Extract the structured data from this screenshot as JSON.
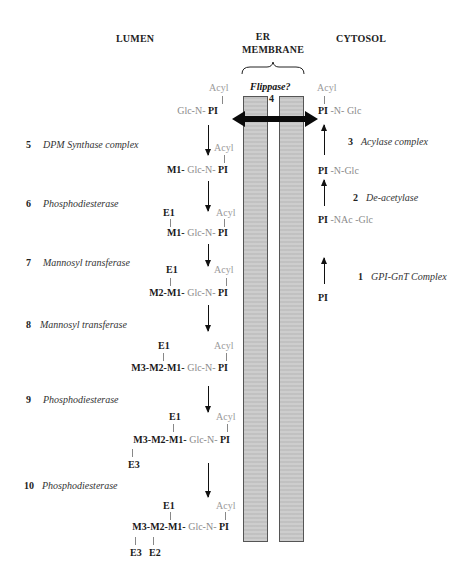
{
  "headers": {
    "lumen": "LUMEN",
    "er_line1": "ER",
    "er_line2": "MEMBRANE",
    "cytosol": "CYTOSOL"
  },
  "flippase": {
    "label": "Flippase?",
    "step": "4"
  },
  "cytosol_steps": [
    {
      "number": "1",
      "enzyme": "GPI-GnT Complex"
    },
    {
      "number": "2",
      "enzyme": "De-acetylase"
    },
    {
      "number": "3",
      "enzyme": "Acylase complex"
    }
  ],
  "cytosol_molecules": {
    "pi": "PI",
    "pi_nacglc": {
      "pi": "PI",
      "rest": "-NAc -Glc"
    },
    "pi_nglc": {
      "pi": "PI",
      "rest": "-N-Glc"
    },
    "pi_nglc_acyl": {
      "acyl": "Acyl",
      "pi": "PI",
      "rest": "-N- Glc"
    }
  },
  "lumen_steps": [
    {
      "number": "5",
      "enzyme": "DPM Synthase complex"
    },
    {
      "number": "6",
      "enzyme": "Phosphodiesterase"
    },
    {
      "number": "7",
      "enzyme": "Mannosyl transferase"
    },
    {
      "number": "8",
      "enzyme": "Mannosyl transferase"
    },
    {
      "number": "9",
      "enzyme": "Phosphodiesterase"
    },
    {
      "number": "10",
      "enzyme": "Phosphodiesterase"
    }
  ],
  "lumen_molecules": {
    "m0": {
      "acyl": "Acyl",
      "glcn": "Glc-N-",
      "pi": "PI"
    },
    "m1": {
      "acyl": "Acyl",
      "man": "M1-",
      "glcn": "Glc-N-",
      "pi": "PI"
    },
    "m2": {
      "acyl": "Acyl",
      "e1": "E1",
      "man": "M1-",
      "glcn": "Glc-N-",
      "pi": "PI"
    },
    "m3": {
      "acyl": "Acyl",
      "e1": "E1",
      "man": "M2-M1-",
      "glcn": "Glc-N-",
      "pi": "PI"
    },
    "m4": {
      "acyl": "Acyl",
      "e1": "E1",
      "man": "M3-M2-M1-",
      "glcn": "Glc-N-",
      "pi": "PI"
    },
    "m5": {
      "acyl": "Acyl",
      "e1": "E1",
      "man": "M3-M2-M1-",
      "glcn": "Glc-N-",
      "pi": "PI",
      "e3": "E3"
    },
    "m6": {
      "acyl": "Acyl",
      "e1": "E1",
      "man": "M3-M2-M1-",
      "glcn": "Glc-N-",
      "pi": "PI",
      "e3": "E3",
      "e2": "E2"
    }
  },
  "colors": {
    "membrane_fill": "#c9c9c9",
    "acyl_text": "#9a9a9a",
    "arrow": "#111111"
  }
}
